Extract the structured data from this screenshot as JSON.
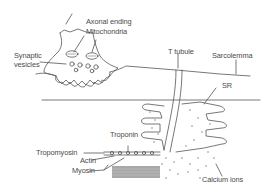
{
  "diagram": {
    "labels": {
      "axonal_ending": "Axonal ending",
      "mitochondria": "Mitochondria",
      "synaptic_vesicles_1": "Synaptic",
      "synaptic_vesicles_2": "vesicles",
      "t_tubule": "T tubule",
      "sarcolemma": "Sarcolemma",
      "sr": "SR",
      "troponin": "Troponin",
      "tropomyosin": "Tropomyosin",
      "actin": "Actin",
      "myosin": "Myosin",
      "calcium_ions": "Calcium ions"
    },
    "colors": {
      "line": "#555555",
      "text": "#4a4a4a",
      "myosin_fill": "#a8a8a8",
      "background": "#ffffff"
    }
  }
}
